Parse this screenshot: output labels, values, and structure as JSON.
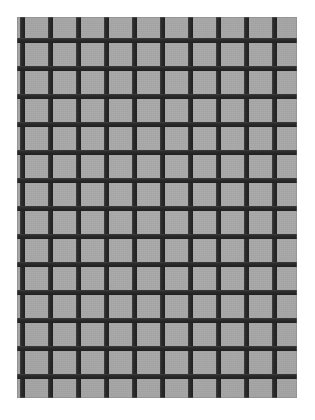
{
  "image": {
    "kind": "grid-pattern-photograph",
    "width": 315,
    "height": 420,
    "background_color": "#ffffff",
    "alt_text": "Grayscale photograph of a dark square lattice grid over a gray background",
    "caption": ""
  },
  "field": {
    "name": "gray-background-field",
    "color": "#a9a9a9",
    "left": 17,
    "top": 17,
    "width": 280,
    "height": 381
  },
  "grid": {
    "line_color": "#2b2b2b",
    "line_width": 5,
    "column_pitch": 28,
    "row_pitch": 28,
    "column_count": 10,
    "row_count": 14,
    "vertical_line_positions": [
      20,
      48,
      76,
      104,
      132,
      160,
      188,
      216,
      244,
      272
    ],
    "horizontal_line_positions": [
      38,
      66,
      94,
      122,
      150,
      178,
      206,
      234,
      262,
      290,
      318,
      346,
      374,
      402
    ],
    "starts_with_horizontal_line": false,
    "ends_with_horizontal_line": false
  }
}
